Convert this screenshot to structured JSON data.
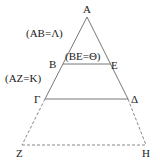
{
  "diagram": {
    "type": "geometry-triangle-with-parallels",
    "points": {
      "A": {
        "label": "A",
        "x": 87,
        "y": 17
      },
      "B": {
        "label": "B",
        "x": 63,
        "y": 64
      },
      "E": {
        "label": "E",
        "x": 111,
        "y": 64
      },
      "Gamma": {
        "label": "Γ",
        "x": 45,
        "y": 99
      },
      "Delta": {
        "label": "Δ",
        "x": 128,
        "y": 99
      },
      "Z": {
        "label": "Z",
        "x": 22,
        "y": 145
      },
      "H": {
        "label": "H",
        "x": 146,
        "y": 145
      }
    },
    "annotations": {
      "ab": "(AB=Λ)",
      "be": "(BE=Θ)",
      "az": "(AZ=K)"
    },
    "colors": {
      "line": "#777777",
      "dashed": "#888888",
      "text": "#222222"
    }
  }
}
